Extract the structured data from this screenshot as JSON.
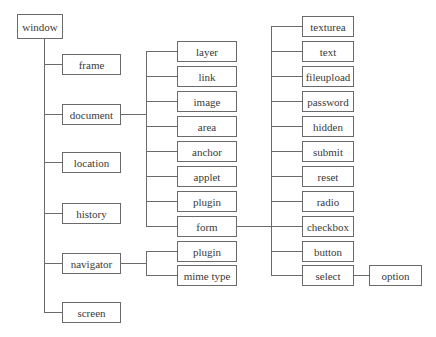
{
  "diagram": {
    "type": "tree",
    "title": "",
    "root": {
      "label": "window"
    },
    "level1": [
      {
        "label": "frame"
      },
      {
        "label": "document"
      },
      {
        "label": "location"
      },
      {
        "label": "history"
      },
      {
        "label": "navigator"
      },
      {
        "label": "screen"
      }
    ],
    "document_children": [
      {
        "label": "layer"
      },
      {
        "label": "link"
      },
      {
        "label": "image"
      },
      {
        "label": "area"
      },
      {
        "label": "anchor"
      },
      {
        "label": "applet"
      },
      {
        "label": "plugin"
      },
      {
        "label": "form"
      }
    ],
    "navigator_children": [
      {
        "label": "plugin"
      },
      {
        "label": "mime type"
      }
    ],
    "form_children": [
      {
        "label": "texturea"
      },
      {
        "label": "text"
      },
      {
        "label": "fileupload"
      },
      {
        "label": "password"
      },
      {
        "label": "hidden"
      },
      {
        "label": "submit"
      },
      {
        "label": "reset"
      },
      {
        "label": "radio"
      },
      {
        "label": "checkbox"
      },
      {
        "label": "button"
      },
      {
        "label": "select"
      }
    ],
    "select_children": [
      {
        "label": "option"
      }
    ],
    "colors": {
      "line": "#6a6a6a",
      "text": "#3a3a3a",
      "background": "#ffffff"
    }
  }
}
